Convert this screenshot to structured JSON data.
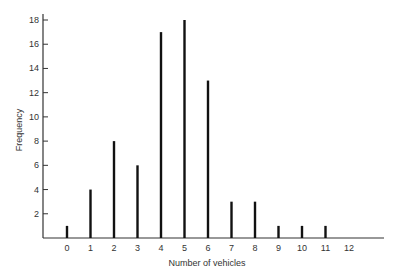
{
  "chart_data": {
    "type": "bar",
    "title": "",
    "xlabel": "Number of vehicles",
    "ylabel": "Frequency",
    "categories": [
      "0",
      "1",
      "2",
      "3",
      "4",
      "5",
      "6",
      "7",
      "8",
      "9",
      "10",
      "11",
      "12"
    ],
    "values": [
      1,
      4,
      8,
      6,
      17,
      18,
      13,
      3,
      3,
      1,
      1,
      1,
      0
    ],
    "yticks": [
      2,
      4,
      6,
      8,
      10,
      12,
      14,
      16,
      18
    ],
    "ylim": [
      0,
      18
    ],
    "grid": false,
    "legend": null,
    "bar_style": "thin vertical lines",
    "colors": {
      "bar": "#111111",
      "axis": "#333333"
    }
  }
}
